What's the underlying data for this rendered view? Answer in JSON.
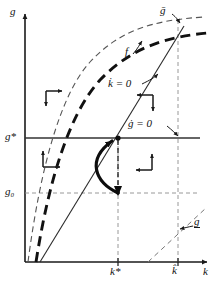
{
  "figure": {
    "type": "phase-diagram",
    "title": "",
    "axes": {
      "x_label": "k",
      "y_label": "g",
      "x_axis_y_px": 262,
      "y_axis_x_px": 25,
      "origin": [
        25,
        262
      ]
    },
    "tick_labels": {
      "x": [
        {
          "text": "k*",
          "value_px": 118
        },
        {
          "text": "k̂",
          "value_px": 178
        }
      ],
      "y": [
        {
          "text": "g*",
          "value_px": 138
        },
        {
          "text": "g₀",
          "value_px": 193
        }
      ]
    },
    "curve_labels": [
      {
        "name": "g-bar-label",
        "text": "ḡ",
        "x": 163,
        "y": 11
      },
      {
        "name": "f-label",
        "text": "f",
        "x": 127,
        "y": 52
      },
      {
        "name": "kdot-zero-label",
        "text": "k̇ = 0",
        "x": 111,
        "y": 85
      },
      {
        "name": "gdot-zero-label",
        "text": "ġ = 0",
        "x": 131,
        "y": 124
      },
      {
        "name": "g-underbar-label",
        "text": "g",
        "x": 197,
        "y": 222
      }
    ],
    "legend_text": {
      "upper_dashed_curve": "ḡ",
      "thick_dashed_curve": "f",
      "solid_diagonal": "k̇ = 0",
      "horizontal_line": "ġ = 0",
      "lower_dashed_line": "g"
    },
    "colors": {
      "ink": "#1a1a1a",
      "grid": "#8a8a8a",
      "background": "#ffffff"
    },
    "phase_arrows": [
      {
        "name": "quadrant-upper-left-arrows",
        "directions": [
          "right",
          "down"
        ],
        "x": 48,
        "y": 95
      },
      {
        "name": "quadrant-lower-left-arrows",
        "directions": [
          "up",
          "right"
        ],
        "x": 42,
        "y": 155
      },
      {
        "name": "quadrant-upper-right-arrows",
        "directions": [
          "left",
          "down"
        ],
        "x": 140,
        "y": 95
      },
      {
        "name": "quadrant-lower-right-arrows",
        "directions": [
          "up",
          "left"
        ],
        "x": 145,
        "y": 155
      }
    ],
    "trajectory": {
      "name": "saddle-path-trajectory",
      "from": [
        118,
        193
      ],
      "to": [
        118,
        138
      ],
      "style": "thick-curved-arrow"
    }
  }
}
